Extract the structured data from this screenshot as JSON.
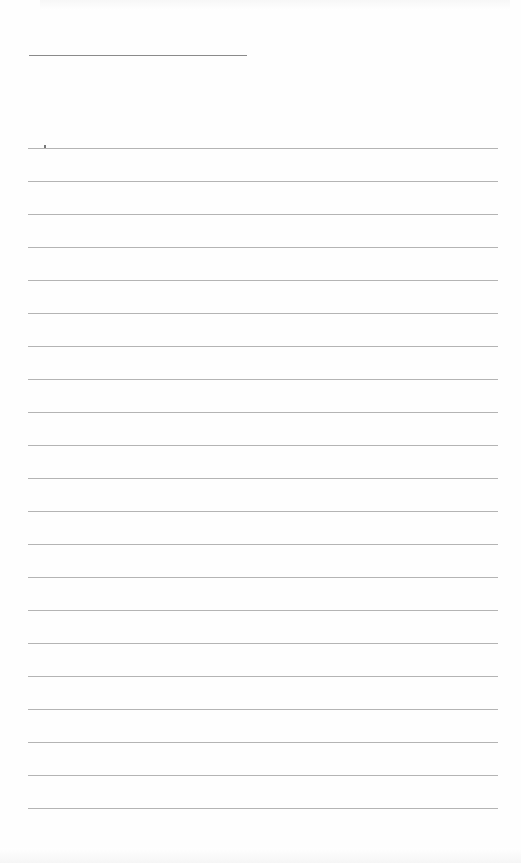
{
  "document": {
    "type": "lined writing sheet",
    "title_line": {
      "left": 29,
      "top": 55,
      "width": 218
    },
    "rules": {
      "count": 21,
      "first_top": 148,
      "spacing": 33,
      "left": 28,
      "width": 470,
      "color": "#b4b4b4"
    },
    "text": ""
  }
}
